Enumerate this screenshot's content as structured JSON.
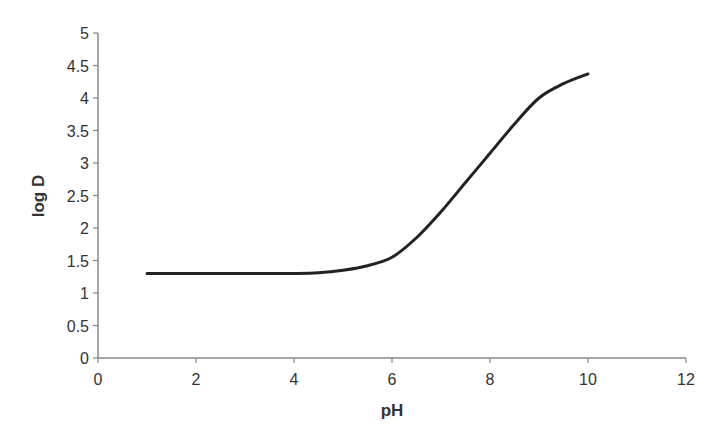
{
  "chart_data": {
    "type": "line",
    "title": "",
    "xlabel": "pH",
    "ylabel": "log D",
    "xlim": [
      0,
      12
    ],
    "ylim": [
      0,
      5
    ],
    "xticks": [
      0,
      2,
      4,
      6,
      8,
      10,
      12
    ],
    "yticks": [
      0,
      0.5,
      1,
      1.5,
      2,
      2.5,
      3,
      3.5,
      4,
      4.5,
      5
    ],
    "grid": false,
    "legend": null,
    "series": [
      {
        "name": "log D",
        "x": [
          1,
          2,
          3,
          4,
          4.5,
          5,
          5.5,
          6,
          6.5,
          7,
          7.5,
          8,
          8.5,
          9,
          9.5,
          10
        ],
        "values": [
          1.3,
          1.3,
          1.3,
          1.3,
          1.31,
          1.35,
          1.42,
          1.55,
          1.85,
          2.25,
          2.7,
          3.15,
          3.6,
          4.0,
          4.22,
          4.37
        ]
      }
    ]
  },
  "colors": {
    "axis": "#888888",
    "line": "#222222",
    "text": "#333333"
  }
}
